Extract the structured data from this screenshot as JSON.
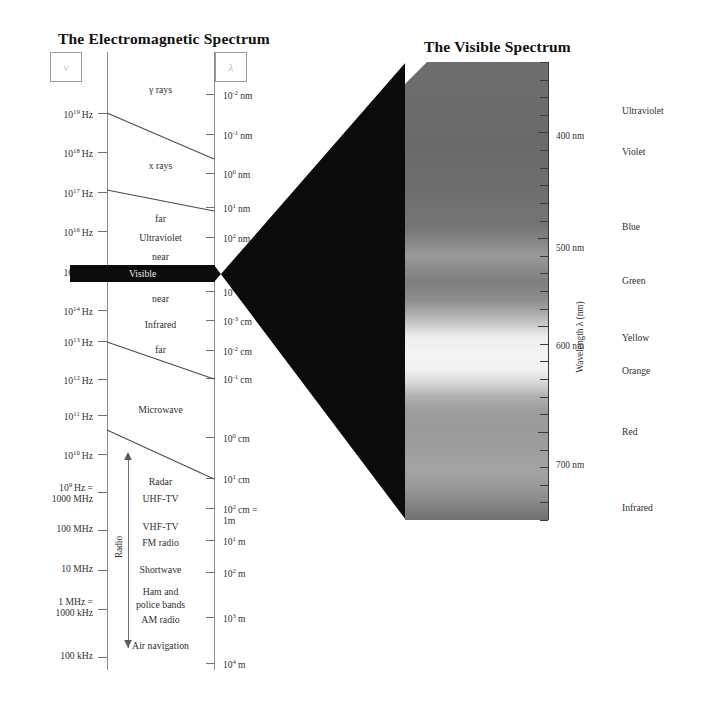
{
  "figure": {
    "left_title": "The Electromagnetic Spectrum",
    "right_title": "The Visible Spectrum",
    "frequency_symbol": "ν",
    "wavelength_symbol": "λ"
  },
  "frequency_axis": {
    "name": "frequency",
    "ticks": [
      {
        "label": "10¹⁹ Hz",
        "mantissa": "10",
        "exponent": "19",
        "unit": "Hz",
        "y": 113
      },
      {
        "label": "10¹⁸ Hz",
        "mantissa": "10",
        "exponent": "18",
        "unit": "Hz",
        "y": 152
      },
      {
        "label": "10¹⁷ Hz",
        "mantissa": "10",
        "exponent": "17",
        "unit": "Hz",
        "y": 192
      },
      {
        "label": "10¹⁶ Hz",
        "mantissa": "10",
        "exponent": "16",
        "unit": "Hz",
        "y": 231
      },
      {
        "label": "10¹⁵ Hz",
        "mantissa": "10",
        "exponent": "15",
        "unit": "Hz",
        "y": 271
      },
      {
        "label": "10¹⁴ Hz",
        "mantissa": "10",
        "exponent": "14",
        "unit": "Hz",
        "y": 310
      },
      {
        "label": "10¹³ Hz",
        "mantissa": "10",
        "exponent": "13",
        "unit": "Hz",
        "y": 341
      },
      {
        "label": "10¹² Hz",
        "mantissa": "10",
        "exponent": "12",
        "unit": "Hz",
        "y": 379
      },
      {
        "label": "10¹¹ Hz",
        "mantissa": "10",
        "exponent": "11",
        "unit": "Hz",
        "y": 415
      },
      {
        "label": "10¹⁰ Hz",
        "mantissa": "10",
        "exponent": "10",
        "unit": "Hz",
        "y": 454
      },
      {
        "label": "10⁹ Hz = 1000 MHz",
        "mantissa": "10",
        "exponent": "9",
        "unit": "Hz =",
        "unit2": "1000 MHz",
        "y": 492
      },
      {
        "label": "100 MHz",
        "plain": "100 MHz",
        "y": 530
      },
      {
        "label": "10 MHz",
        "plain": "10 MHz",
        "y": 570
      },
      {
        "label": "1 MHz = 1000 kHz",
        "plain": "1 MHz =",
        "plain2": "1000 kHz",
        "y": 609
      },
      {
        "label": "100 kHz",
        "plain": "100 kHz",
        "y": 657
      }
    ]
  },
  "wavelength_axis": {
    "name": "wavelength",
    "ticks": [
      {
        "mantissa": "10",
        "exponent": "-2",
        "unit": "nm",
        "y": 94
      },
      {
        "mantissa": "10",
        "exponent": "-1",
        "unit": "nm",
        "y": 134
      },
      {
        "mantissa": "10",
        "exponent": "0",
        "unit": "nm",
        "y": 173
      },
      {
        "mantissa": "10",
        "exponent": "1",
        "unit": "nm",
        "y": 207
      },
      {
        "mantissa": "10",
        "exponent": "2",
        "unit": "nm",
        "y": 237
      },
      {
        "mantissa": "10",
        "exponent": "3",
        "unit": "nm",
        "y": 273
      },
      {
        "mantissa": "10",
        "exponent": "-4",
        "unit": "cm",
        "y": 291
      },
      {
        "mantissa": "10",
        "exponent": "-3",
        "unit": "cm",
        "y": 320
      },
      {
        "mantissa": "10",
        "exponent": "-2",
        "unit": "cm",
        "y": 350
      },
      {
        "mantissa": "10",
        "exponent": "-1",
        "unit": "cm",
        "y": 378
      },
      {
        "mantissa": "10",
        "exponent": "0",
        "unit": "cm",
        "y": 437
      },
      {
        "mantissa": "10",
        "exponent": "1",
        "unit": "cm",
        "y": 478
      },
      {
        "mantissa": "10",
        "exponent": "2",
        "unit": "cm =",
        "unit2": "1m",
        "y": 508
      },
      {
        "mantissa": "10",
        "exponent": "1",
        "unit": "m",
        "y": 540
      },
      {
        "mantissa": "10",
        "exponent": "2",
        "unit": "m",
        "y": 572
      },
      {
        "mantissa": "10",
        "exponent": "3",
        "unit": "m",
        "y": 617
      },
      {
        "mantissa": "10",
        "exponent": "4",
        "unit": "m",
        "y": 663
      }
    ]
  },
  "spectrum_bands": [
    {
      "label": "γ rays",
      "y": 90
    },
    {
      "label": "x rays",
      "y": 166
    },
    {
      "label": "far",
      "y": 219
    },
    {
      "label": "Ultraviolet",
      "y": 238
    },
    {
      "label": "near",
      "y": 257
    },
    {
      "label": "Visible",
      "y": 272,
      "highlight": true
    },
    {
      "label": "near",
      "y": 299
    },
    {
      "label": "Infrared",
      "y": 325
    },
    {
      "label": "far",
      "y": 350
    },
    {
      "label": "Microwave",
      "y": 410
    },
    {
      "label": "Radar",
      "y": 482
    },
    {
      "label": "UHF-TV",
      "y": 499
    },
    {
      "label": "VHF-TV",
      "y": 527
    },
    {
      "label": "FM radio",
      "y": 543
    },
    {
      "label": "Shortwave",
      "y": 570
    },
    {
      "label": "Ham and",
      "y": 592
    },
    {
      "label": "police bands",
      "y": 605
    },
    {
      "label": "AM radio",
      "y": 620
    },
    {
      "label": "Air navigation",
      "y": 646
    }
  ],
  "radio_bracket": {
    "label": "Radio",
    "top_y": 455,
    "bottom_y": 648
  },
  "visible_panel": {
    "axis_title": "Wavelength λ (nm)",
    "wavelength_labels": [
      {
        "text": "400 nm",
        "y": 137
      },
      {
        "text": "500 nm",
        "y": 249
      },
      {
        "text": "600 nm",
        "y": 347
      },
      {
        "text": "700 nm",
        "y": 466
      }
    ],
    "colors": [
      {
        "name": "Ultraviolet",
        "y": 111
      },
      {
        "name": "Violet",
        "y": 152
      },
      {
        "name": "Blue",
        "y": 227
      },
      {
        "name": "Green",
        "y": 281
      },
      {
        "name": "Yellow",
        "y": 338
      },
      {
        "name": "Orange",
        "y": 371
      },
      {
        "name": "Red",
        "y": 432
      },
      {
        "name": "Infrared",
        "y": 508
      }
    ],
    "panel_rect": {
      "x": 405,
      "y": 62,
      "width": 143,
      "height": 458
    },
    "tick_count": 26
  },
  "palette": {
    "background": "#ffffff",
    "ink": "#2b2b2b",
    "axis": "#8b8b8b",
    "visible_band": "#0b0b0b",
    "panel_dark": "#6b6b6b",
    "panel_bright": "#f2f2f2"
  }
}
